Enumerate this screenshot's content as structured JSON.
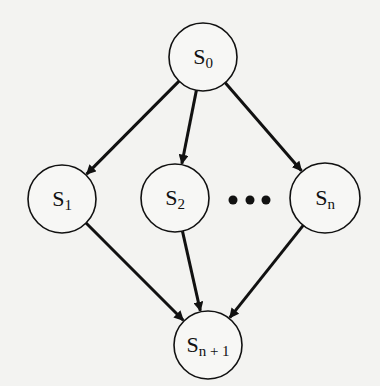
{
  "diagram": {
    "type": "directed-graph",
    "nodes": [
      {
        "id": "s0",
        "label": "S",
        "sub": "0",
        "cx": 203,
        "cy": 57,
        "r": 34
      },
      {
        "id": "s1",
        "label": "S",
        "sub": "1",
        "cx": 62,
        "cy": 199,
        "r": 34
      },
      {
        "id": "s2",
        "label": "S",
        "sub": "2",
        "cx": 175,
        "cy": 198,
        "r": 34
      },
      {
        "id": "sn",
        "label": "S",
        "sub": "n",
        "cx": 325,
        "cy": 198,
        "r": 35
      },
      {
        "id": "sn1",
        "label": "S",
        "sub": "n + 1",
        "cx": 208,
        "cy": 345,
        "r": 34
      }
    ],
    "edges": [
      {
        "from": "s0",
        "to": "s1"
      },
      {
        "from": "s0",
        "to": "s2"
      },
      {
        "from": "s0",
        "to": "sn"
      },
      {
        "from": "s1",
        "to": "sn1"
      },
      {
        "from": "s2",
        "to": "sn1"
      },
      {
        "from": "sn",
        "to": "sn1"
      }
    ],
    "ellipsis": {
      "dots": [
        233,
        250,
        266
      ],
      "y": 200,
      "r": 4.5
    },
    "colors": {
      "background": "#f3f3f1",
      "stroke": "#111111",
      "node_fill": "#f7f7f5"
    }
  }
}
